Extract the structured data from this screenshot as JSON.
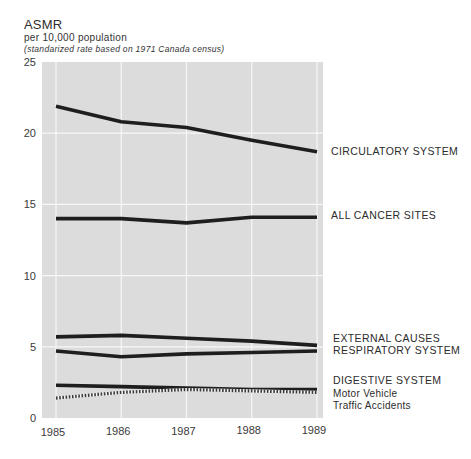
{
  "header": {
    "title": "ASMR",
    "subtitle": "per 10,000 population",
    "note": "(standarized rate based on 1971 Canada census)"
  },
  "colors": {
    "plot_background": "#dcdcdc",
    "gridline": "#f7f7f7",
    "line": "#1e1e1e"
  },
  "chart_data": {
    "type": "line",
    "title": "ASMR",
    "subtitle": "per 10,000 population (standarized rate based on 1971 Canada census)",
    "xlabel": "",
    "ylabel": "ASMR per 10,000 population",
    "x": [
      1985,
      1986,
      1987,
      1988,
      1989
    ],
    "ylim": [
      0,
      25
    ],
    "yticks": [
      0,
      5,
      10,
      15,
      20,
      25
    ],
    "grid": true,
    "legend_position": "right (direct labels)",
    "series": [
      {
        "name": "CIRCULATORY SYSTEM",
        "values": [
          21.9,
          20.8,
          20.4,
          19.5,
          18.7
        ],
        "style": "solid"
      },
      {
        "name": "ALL CANCER SITES",
        "values": [
          14.0,
          14.0,
          13.7,
          14.1,
          14.1
        ],
        "style": "solid"
      },
      {
        "name": "EXTERNAL CAUSES",
        "values": [
          5.7,
          5.8,
          5.6,
          5.4,
          5.1
        ],
        "style": "solid"
      },
      {
        "name": "RESPIRATORY SYSTEM",
        "values": [
          4.7,
          4.3,
          4.5,
          4.6,
          4.7
        ],
        "style": "solid"
      },
      {
        "name": "DIGESTIVE SYSTEM",
        "values": [
          2.3,
          2.2,
          2.1,
          2.0,
          2.0
        ],
        "style": "solid"
      },
      {
        "name": "Motor Vehicle Traffic Accidents",
        "values": [
          1.4,
          1.8,
          2.0,
          1.9,
          1.8
        ],
        "style": "dotted"
      }
    ]
  },
  "labels": {
    "circulatory": "CIRCULATORY SYSTEM",
    "cancer": "ALL CANCER SITES",
    "external": "EXTERNAL CAUSES",
    "respiratory": "RESPIRATORY SYSTEM",
    "digestive": "DIGESTIVE SYSTEM",
    "motor_line1": "Motor Vehicle",
    "motor_line2": "Traffic Accidents"
  }
}
